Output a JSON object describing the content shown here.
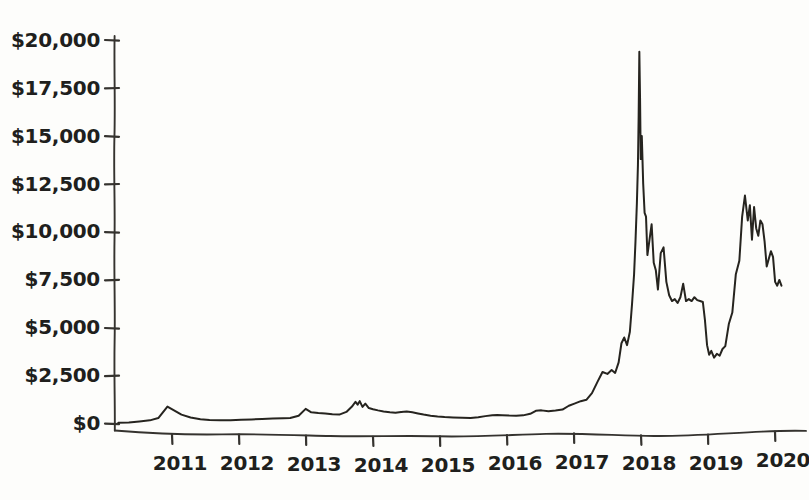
{
  "chart_data": {
    "type": "line",
    "title": "",
    "subtitle": "",
    "xlabel": "",
    "ylabel": "",
    "style": "hand-drawn sketch",
    "grid": false,
    "legend": null,
    "legend_position": "none",
    "line_color": "#26241f",
    "axis_color": "#35332f",
    "background_color": "#fdfdfb",
    "text_color": "#201f1d",
    "xlim": [
      2010.5,
      2020.35
    ],
    "ylim": [
      0,
      20000
    ],
    "ytick_labels": [
      "$20,000",
      "$17,500",
      "$15,000",
      "$12,500",
      "$10,000",
      "$7,500",
      "$5,000",
      "$2,500",
      "$0"
    ],
    "ytick_values": [
      20000,
      17500,
      15000,
      12500,
      10000,
      7500,
      5000,
      2500,
      0
    ],
    "xtick_labels": [
      "2011",
      "2012",
      "2013",
      "2014",
      "2015",
      "2016",
      "2017",
      "2018",
      "2019",
      "2020"
    ],
    "xtick_values": [
      2011,
      2012,
      2013,
      2014,
      2015,
      2016,
      2017,
      2018,
      2019,
      2020
    ],
    "series": [
      {
        "name": "Price",
        "x": [
          2010.55,
          2010.7,
          2010.85,
          2011.0,
          2011.12,
          2011.25,
          2011.45,
          2011.58,
          2011.72,
          2011.85,
          2012.0,
          2012.15,
          2012.3,
          2012.45,
          2012.6,
          2012.75,
          2012.9,
          2013.0,
          2013.12,
          2013.22,
          2013.3,
          2013.4,
          2013.5,
          2013.6,
          2013.7,
          2013.8,
          2013.88,
          2013.93,
          2013.96,
          2013.99,
          2014.03,
          2014.07,
          2014.12,
          2014.18,
          2014.25,
          2014.33,
          2014.42,
          2014.5,
          2014.58,
          2014.66,
          2014.74,
          2014.82,
          2014.9,
          2015.0,
          2015.1,
          2015.2,
          2015.32,
          2015.45,
          2015.57,
          2015.68,
          2015.78,
          2015.88,
          2015.95,
          2016.02,
          2016.12,
          2016.22,
          2016.32,
          2016.42,
          2016.5,
          2016.58,
          2016.68,
          2016.78,
          2016.88,
          2016.97,
          2017.05,
          2017.14,
          2017.22,
          2017.3,
          2017.38,
          2017.45,
          2017.52,
          2017.58,
          2017.63,
          2017.68,
          2017.72,
          2017.76,
          2017.8,
          2017.84,
          2017.87,
          2017.9,
          2017.92,
          2017.94,
          2017.955,
          2017.965,
          2017.975,
          2017.985,
          2017.995,
          2018.01,
          2018.03,
          2018.05,
          2018.07,
          2018.09,
          2018.12,
          2018.15,
          2018.18,
          2018.21,
          2018.24,
          2018.28,
          2018.32,
          2018.36,
          2018.4,
          2018.44,
          2018.48,
          2018.52,
          2018.56,
          2018.6,
          2018.64,
          2018.68,
          2018.72,
          2018.76,
          2018.8,
          2018.84,
          2018.88,
          2018.91,
          2018.94,
          2018.97,
          2019.0,
          2019.04,
          2019.08,
          2019.12,
          2019.16,
          2019.2,
          2019.25,
          2019.3,
          2019.35,
          2019.4,
          2019.44,
          2019.48,
          2019.52,
          2019.55,
          2019.58,
          2019.61,
          2019.64,
          2019.67,
          2019.7,
          2019.73,
          2019.76,
          2019.79,
          2019.82,
          2019.85,
          2019.88,
          2019.91,
          2019.94,
          2019.97,
          2020.0
        ],
        "y": [
          60,
          70,
          120,
          180,
          300,
          900,
          480,
          330,
          240,
          200,
          180,
          190,
          210,
          230,
          250,
          270,
          290,
          300,
          420,
          780,
          600,
          560,
          540,
          500,
          480,
          620,
          900,
          1150,
          1000,
          1180,
          880,
          1050,
          820,
          760,
          700,
          640,
          600,
          580,
          620,
          640,
          600,
          540,
          480,
          420,
          380,
          350,
          330,
          310,
          300,
          340,
          400,
          450,
          460,
          450,
          430,
          420,
          440,
          520,
          680,
          700,
          660,
          690,
          740,
          940,
          1050,
          1180,
          1250,
          1600,
          2200,
          2700,
          2600,
          2800,
          2650,
          3200,
          4200,
          4500,
          4100,
          4800,
          6200,
          7800,
          9500,
          11500,
          13500,
          16000,
          19400,
          17000,
          13800,
          15000,
          12500,
          11000,
          10800,
          8800,
          9600,
          10400,
          8400,
          8000,
          7000,
          8900,
          9200,
          7400,
          6700,
          6400,
          6500,
          6300,
          6600,
          7300,
          6400,
          6500,
          6400,
          6600,
          6450,
          6400,
          6350,
          5400,
          4100,
          3600,
          3800,
          3450,
          3650,
          3550,
          3900,
          4050,
          5200,
          5800,
          7800,
          8500,
          10800,
          11900,
          10600,
          11400,
          9600,
          11300,
          10200,
          9800,
          10600,
          10400,
          9500,
          8200,
          8600,
          9000,
          8700,
          7400,
          7200,
          7500,
          7200
        ],
        "peak_value": 19400,
        "peak_label": "2017-2018 peak",
        "end_value": 7200
      }
    ]
  }
}
